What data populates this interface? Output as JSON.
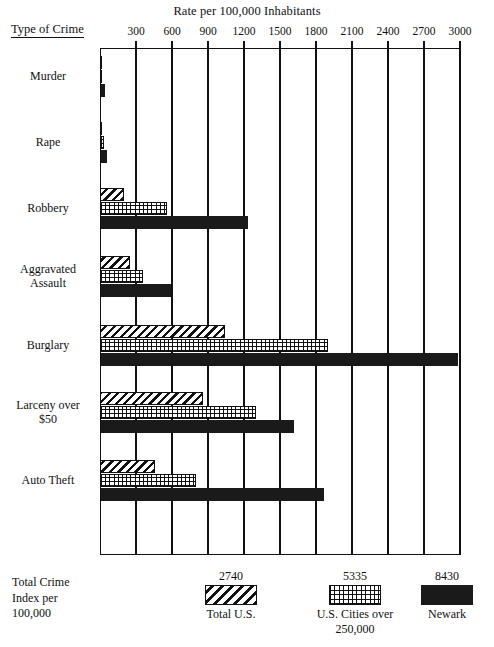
{
  "chart_data": {
    "type": "bar",
    "orientation": "horizontal",
    "title": "Rate per 100,000 Inhabitants",
    "xlabel": "Rate per 100,000 Inhabitants",
    "ylabel": "Type of Crime",
    "xlim": [
      0,
      3100
    ],
    "grid": true,
    "legend_position": "bottom",
    "xticks": [
      300,
      600,
      900,
      1200,
      1500,
      1800,
      2100,
      2400,
      2700,
      3000
    ],
    "categories": [
      "Murder",
      "Rape",
      "Robbery",
      "Aggravated\nAssault",
      "Burglary",
      "Larceny over\n$50",
      "Auto Theft"
    ],
    "series": [
      {
        "name": "Total U.S.",
        "pattern": "diagonal-hatch",
        "values": [
          8,
          18,
          200,
          250,
          1040,
          860,
          460
        ]
      },
      {
        "name": "U.S. Cities over 250,000",
        "pattern": "cross-hatch",
        "values": [
          18,
          30,
          560,
          360,
          1900,
          1300,
          800
        ]
      },
      {
        "name": "Newark",
        "pattern": "solid-black",
        "values": [
          38,
          55,
          1230,
          590,
          2980,
          1620,
          1870
        ]
      }
    ]
  },
  "header": {
    "chart_title": "Rate per 100,000 Inhabitants",
    "y_axis_title": "Type of Crime"
  },
  "axis": {
    "ticks": [
      "300",
      "600",
      "900",
      "1200",
      "1500",
      "1800",
      "2100",
      "2400",
      "2700",
      "3000"
    ]
  },
  "categories": [
    {
      "label": "Murder"
    },
    {
      "label": "Rape"
    },
    {
      "label": "Robbery"
    },
    {
      "label": "Aggravated\nAssault"
    },
    {
      "label": "Burglary"
    },
    {
      "label": "Larceny over\n$50"
    },
    {
      "label": "Auto Theft"
    }
  ],
  "legend": {
    "title": "Total Crime\nIndex per\n100,000",
    "items": [
      {
        "value": "2740",
        "label": "Total U.S."
      },
      {
        "value": "5335",
        "label": "U.S. Cities over\n250,000"
      },
      {
        "value": "8430",
        "label": "Newark"
      }
    ]
  },
  "colors": {
    "ink": "#111111",
    "paper": "#ffffff",
    "newark_fill": "#1a1a1a"
  }
}
